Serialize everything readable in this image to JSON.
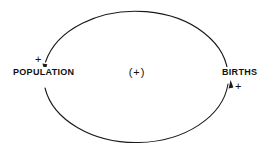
{
  "diagram": {
    "type": "causal-loop-diagram",
    "loop_polarity_label": "(+)",
    "stroke_color": "#1a1a1a",
    "text_color": "#111111",
    "background_color": "#ffffff",
    "nodes": [
      {
        "id": "population",
        "label": "POPULATION",
        "polarity": "+",
        "arrow_direction": "down"
      },
      {
        "id": "births",
        "label": "BIRTHS",
        "polarity": "+",
        "arrow_direction": "up"
      }
    ],
    "ellipse": {
      "cx": 135.5,
      "cy": 77,
      "rx": 92.5,
      "ry": 66
    }
  }
}
